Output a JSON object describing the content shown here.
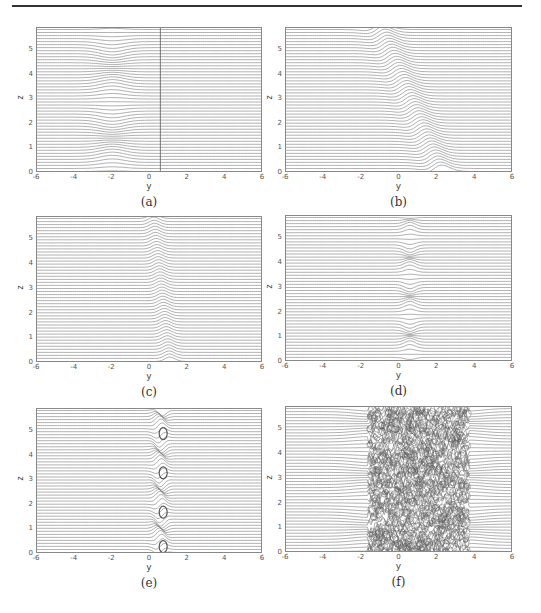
{
  "figure": {
    "panels": [
      {
        "id": "a",
        "caption": "(a)",
        "frame": {
          "x": 36,
          "y": 27,
          "w": 226,
          "h": 145
        },
        "mode": "sheet",
        "center": -2.0,
        "amp": 0.35,
        "width": 0.9,
        "tilt": 0.0,
        "vline": 0.55
      },
      {
        "id": "b",
        "caption": "(b)",
        "frame": {
          "x": 285,
          "y": 27,
          "w": 227,
          "h": 145
        },
        "mode": "tilt",
        "center": 0.3,
        "amp": 0.55,
        "width": 0.8,
        "tilt": -0.18
      },
      {
        "id": "c",
        "caption": "(c)",
        "frame": {
          "x": 36,
          "y": 216,
          "w": 226,
          "h": 146
        },
        "mode": "tilt",
        "center": 0.45,
        "amp": 0.35,
        "width": 0.45,
        "tilt": -0.05
      },
      {
        "id": "d",
        "caption": "(d)",
        "frame": {
          "x": 285,
          "y": 215,
          "w": 227,
          "h": 146
        },
        "mode": "kink",
        "center": 0.55,
        "amp": 0.3,
        "width": 0.4,
        "tilt": 0.0
      },
      {
        "id": "e",
        "caption": "(e)",
        "frame": {
          "x": 36,
          "y": 408,
          "w": 226,
          "h": 145
        },
        "mode": "roll",
        "center": 0.55,
        "amp": 0.35,
        "width": 0.35,
        "tilt": 0.0
      },
      {
        "id": "f",
        "caption": "(f)",
        "frame": {
          "x": 285,
          "y": 406,
          "w": 227,
          "h": 146
        },
        "mode": "turbulent",
        "center": 1.0,
        "amp": 0.4,
        "width": 2.6,
        "tilt": 0.0
      }
    ],
    "axes": {
      "xlabel": "y",
      "ylabel": "z",
      "xticks": [
        "-6",
        "-4",
        "-2",
        "0",
        "2",
        "4",
        "6"
      ],
      "yticks": [
        "0",
        "1",
        "2",
        "3",
        "4",
        "5"
      ],
      "xlim": [
        -6,
        6
      ],
      "ylim": [
        0,
        5.9
      ],
      "n_lines": 48
    },
    "colors": {
      "line": "#7a7a7a",
      "frame": "#888888",
      "dense": "#555555"
    }
  },
  "chart_data": [
    {
      "type": "line",
      "panel": "(a)",
      "title": "",
      "xlabel": "y",
      "ylabel": "z",
      "xlim": [
        -6,
        6
      ],
      "ylim": [
        0,
        5.9
      ],
      "xticks": [
        -6,
        -4,
        -2,
        0,
        2,
        4,
        6
      ],
      "yticks": [
        0,
        1,
        2,
        3,
        4,
        5
      ],
      "grid": false,
      "description": "Horizontal streamlines; mild wavy perturbation near y=-2; vertical line at y≈0.55"
    },
    {
      "type": "line",
      "panel": "(b)",
      "title": "",
      "xlabel": "y",
      "ylabel": "z",
      "xlim": [
        -6,
        6
      ],
      "ylim": [
        0,
        5.9
      ],
      "xticks": [
        -6,
        -4,
        -2,
        0,
        2,
        4,
        6
      ],
      "yticks": [
        0,
        1,
        2,
        3,
        4,
        5
      ],
      "grid": false,
      "description": "Streamlines deflected in a tilted band spanning y≈-2 to 1"
    },
    {
      "type": "line",
      "panel": "(c)",
      "title": "",
      "xlabel": "y",
      "ylabel": "z",
      "xlim": [
        -6,
        6
      ],
      "ylim": [
        0,
        5.9
      ],
      "xticks": [
        -6,
        -4,
        -2,
        0,
        2,
        4,
        6
      ],
      "yticks": [
        0,
        1,
        2,
        3,
        4,
        5
      ],
      "grid": false,
      "description": "Narrow tilted shear layer near y≈0.5"
    },
    {
      "type": "line",
      "panel": "(d)",
      "title": "",
      "xlabel": "y",
      "ylabel": "z",
      "xlim": [
        -6,
        6
      ],
      "ylim": [
        0,
        5.9
      ],
      "xticks": [
        -6,
        -4,
        -2,
        0,
        2,
        4,
        6
      ],
      "yticks": [
        0,
        1,
        2,
        3,
        4,
        5
      ],
      "grid": false,
      "description": "Kinked shear layer near y≈0.5 with periodic kinks at z≈0.3,1.9,3.4,5.0"
    },
    {
      "type": "line",
      "panel": "(e)",
      "title": "",
      "xlabel": "y",
      "ylabel": "z",
      "xlim": [
        -6,
        6
      ],
      "ylim": [
        0,
        5.9
      ],
      "xticks": [
        -6,
        -4,
        -2,
        0,
        2,
        4,
        6
      ],
      "yticks": [
        0,
        1,
        2,
        3,
        4,
        5
      ],
      "grid": false,
      "description": "Rolled-up vortices near y≈0.5 at z≈0.3,1.7,3.3,4.9"
    },
    {
      "type": "line",
      "panel": "(f)",
      "title": "",
      "xlabel": "y",
      "ylabel": "z",
      "xlim": [
        -6,
        6
      ],
      "ylim": [
        0,
        5.9
      ],
      "xticks": [
        -6,
        -4,
        -2,
        0,
        2,
        4,
        6
      ],
      "yticks": [
        0,
        1,
        2,
        3,
        4,
        5
      ],
      "grid": false,
      "description": "Fully turbulent mixing region spanning y≈-2 to 4"
    }
  ]
}
